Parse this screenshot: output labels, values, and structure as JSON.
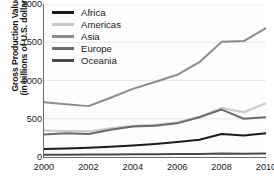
{
  "chart_data": {
    "type": "line",
    "title": "",
    "xlabel": "",
    "ylabel": "Gross Production Value (in billions of U.S. dollars)",
    "ylabel_lines": [
      "Gross Production Value",
      "(in billions of U.S. dollars)"
    ],
    "x": [
      2000,
      2001,
      2002,
      2003,
      2004,
      2005,
      2006,
      2007,
      2008,
      2009,
      2010
    ],
    "xticks": [
      "2000",
      "2002",
      "2004",
      "2006",
      "2008",
      "2010"
    ],
    "xtick_values": [
      2000,
      2002,
      2004,
      2006,
      2008,
      2010
    ],
    "yticks": [
      "0",
      "500",
      "1000",
      "1500",
      "2000"
    ],
    "ytick_values": [
      0,
      500,
      1000,
      1500,
      2000
    ],
    "xlim": [
      2000,
      2010
    ],
    "ylim": [
      0,
      2000
    ],
    "grid": true,
    "legend_position": "top-left",
    "series": [
      {
        "name": "Africa",
        "color": "#1c1c1c",
        "values": [
          105,
          110,
          120,
          135,
          150,
          170,
          195,
          225,
          300,
          280,
          310
        ]
      },
      {
        "name": "Americas",
        "color": "#c9c9c9",
        "values": [
          345,
          340,
          335,
          375,
          410,
          420,
          455,
          525,
          640,
          585,
          705
        ]
      },
      {
        "name": "Asia",
        "color": "#8c8c8c",
        "values": [
          715,
          690,
          665,
          775,
          890,
          980,
          1075,
          1240,
          1505,
          1515,
          1685
        ]
      },
      {
        "name": "Europe",
        "color": "#6b6b6b",
        "values": [
          295,
          310,
          300,
          355,
          400,
          410,
          440,
          520,
          620,
          500,
          520
        ]
      },
      {
        "name": "Oceania",
        "color": "#4a4a4a",
        "values": [
          30,
          31,
          32,
          34,
          36,
          37,
          38,
          40,
          45,
          42,
          46
        ]
      }
    ]
  },
  "legend": {
    "items": [
      {
        "label": "Africa"
      },
      {
        "label": "Americas"
      },
      {
        "label": "Asia"
      },
      {
        "label": "Europe"
      },
      {
        "label": "Oceania"
      }
    ]
  }
}
